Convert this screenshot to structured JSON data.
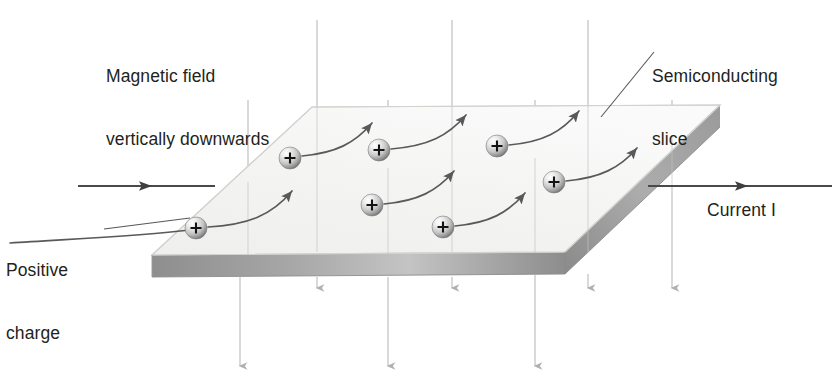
{
  "figure": {
    "type": "physics-diagram"
  },
  "labels": {
    "magnetic_field_line1": "Magnetic field",
    "magnetic_field_line2": "vertically downwards",
    "semiconducting_line1": "Semiconducting",
    "semiconducting_line2": "slice",
    "positive_charge_line1": "Positive",
    "positive_charge_line2": "charge",
    "current_word": "Current",
    "current_symbol": "I"
  },
  "colors": {
    "text": "#231f20",
    "slab_top": "#f2f2f1",
    "slab_front": "#9d9d9d",
    "slab_edge": "#c9c9c6",
    "field_line": "#b8b8b8",
    "current_arrow": "#4a4a4a",
    "charge_arrow": "#595959",
    "sphere_light": "#fbfbfb",
    "sphere_mid": "#d2d2d2",
    "sphere_dark": "#6e6e6e",
    "plus_sign": "#1a1a1a",
    "leader_line": "#5a5a5a"
  },
  "geometry": {
    "slab_top_face": [
      [
        152,
        255
      ],
      [
        312,
        107
      ],
      [
        720,
        105
      ],
      [
        565,
        252
      ]
    ],
    "slab_thickness": 22,
    "canvas": [
      838,
      388
    ]
  },
  "charges": [
    {
      "id": "charge-1",
      "cx": 196,
      "cy": 228,
      "label": "+"
    },
    {
      "id": "charge-2",
      "cx": 290,
      "cy": 158,
      "label": "+"
    },
    {
      "id": "charge-3",
      "cx": 372,
      "cy": 205,
      "label": "+"
    },
    {
      "id": "charge-4",
      "cx": 379,
      "cy": 150,
      "label": "+"
    },
    {
      "id": "charge-5",
      "cx": 443,
      "cy": 227,
      "label": "+"
    },
    {
      "id": "charge-6",
      "cx": 497,
      "cy": 146,
      "label": "+"
    },
    {
      "id": "charge-7",
      "cx": 554,
      "cy": 182,
      "label": "+"
    }
  ],
  "charge_paths": [
    {
      "id": "path-1",
      "d": "M 210 226 C 240 224 258 214 277 196"
    },
    {
      "id": "path-2",
      "d": "M 304 156 C 327 153 341 144 358 129"
    },
    {
      "id": "path-3",
      "d": "M 386 203 C 410 200 425 192 442 176"
    },
    {
      "id": "path-4",
      "d": "M 393 148 C 417 145 431 136 449 121"
    },
    {
      "id": "path-5",
      "d": "M 457 225 C 480 222 494 213 511 197"
    },
    {
      "id": "path-6",
      "d": "M 511 144 C 535 141 549 132 566 117"
    },
    {
      "id": "path-7",
      "d": "M 568 180 C 592 177 606 168 623 152"
    }
  ],
  "field_lines": [
    {
      "id": "field-line-1",
      "x": 248,
      "y1": 100,
      "y2": 370,
      "arrow_mid": false,
      "long": true
    },
    {
      "id": "field-line-2",
      "x": 317,
      "y1": 20,
      "y2": 292,
      "arrow_mid": false,
      "long": false
    },
    {
      "id": "field-line-3",
      "x": 388,
      "y1": 100,
      "y2": 370,
      "arrow_mid": false,
      "long": true
    },
    {
      "id": "field-line-4",
      "x": 452,
      "y1": 20,
      "y2": 292,
      "arrow_mid": false,
      "long": false
    },
    {
      "id": "field-line-5",
      "x": 535,
      "y1": 100,
      "y2": 370,
      "arrow_mid": false,
      "long": true
    },
    {
      "id": "field-line-6",
      "x": 588,
      "y1": 20,
      "y2": 292,
      "arrow_mid": false,
      "long": false
    },
    {
      "id": "field-line-7",
      "x": 672,
      "y1": 100,
      "y2": 292,
      "arrow_mid": false,
      "long": false
    }
  ],
  "current_arrows": [
    {
      "id": "current-arrow-left",
      "x1": 78,
      "x2": 215,
      "y": 186,
      "head_x": 152
    },
    {
      "id": "current-arrow-right",
      "x1": 648,
      "x2": 832,
      "y": 186,
      "head_x": 748
    }
  ],
  "leaders": [
    {
      "id": "leader-semiconducting",
      "d": "M 652 50 L 601 117"
    },
    {
      "id": "leader-positive-charge",
      "d": "M 103 228 L 196 213"
    }
  ]
}
